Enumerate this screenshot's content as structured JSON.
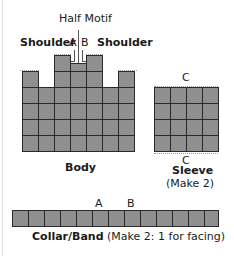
{
  "labels": {
    "half_motif": "Half Motif",
    "shoulder_left": "Shoulder",
    "shoulder_right": "Shoulder",
    "a": "A",
    "b": "B",
    "body": "Body",
    "sleeve_top_c": "C",
    "sleeve_bottom_c": "C",
    "sleeve": "Sleeve",
    "sleeve_make": "(Make 2)",
    "collar_a": "A",
    "collar_b": "B",
    "collar_title": "Collar/Band",
    "collar_make": "(Make 2: 1 for facing)"
  },
  "body_grid": {
    "columns": 7,
    "full_rows": 4,
    "column_heights_in_rows": [
      5,
      4,
      6,
      5.5,
      6,
      4,
      5
    ]
  },
  "sleeve_grid": {
    "columns": 4,
    "rows": 4
  },
  "collar_grid": {
    "columns": 13,
    "rows": 1
  },
  "colors": {
    "cell_fill": "#8f8f8f",
    "grid_line": "#2a2a2a"
  }
}
